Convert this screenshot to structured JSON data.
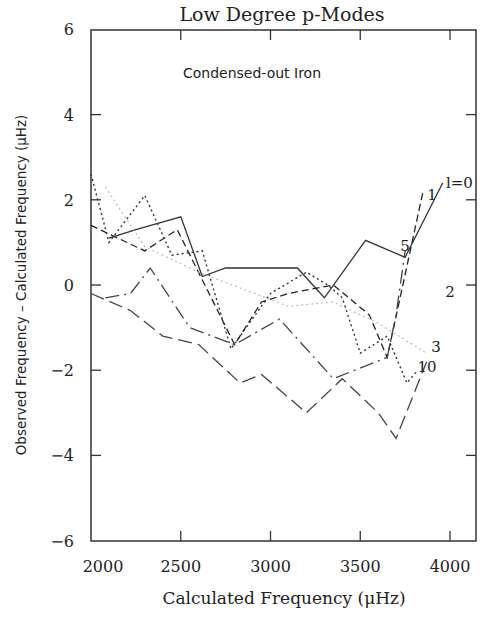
{
  "chart_data": {
    "type": "line",
    "title": "Low Degree p-Modes",
    "annotation": "Condensed-out Iron",
    "xlabel": "Calculated Frequency (μHz)",
    "ylabel": "Observed Frequency – Calculated Frequency (μHz)",
    "xlim": [
      2000,
      4150
    ],
    "ylim": [
      -6,
      6
    ],
    "xticks": [
      2000,
      2500,
      3000,
      3500,
      4000
    ],
    "yticks": [
      6,
      4,
      2,
      0,
      -2,
      -4,
      -6
    ],
    "xtick_labels": [
      "2000",
      "2500",
      "3000",
      "3500",
      "4000"
    ],
    "ytick_labels": [
      "6",
      "4",
      "2",
      "0",
      "−2",
      "−4",
      "−6"
    ],
    "grid": false,
    "legend": "inline labels at line ends",
    "series": [
      {
        "name": "l=0",
        "label": "l=0",
        "style": "solid",
        "x": [
          2100,
          2250,
          2500,
          2620,
          2750,
          3150,
          3300,
          3530,
          3750,
          3960
        ],
        "y": [
          1.1,
          1.3,
          1.6,
          0.2,
          0.4,
          0.4,
          -0.3,
          1.05,
          0.65,
          2.4
        ]
      },
      {
        "name": "l=1",
        "label": "1",
        "style": "short-dash",
        "x": [
          2000,
          2100,
          2300,
          2480,
          2800,
          2950,
          3100,
          3350,
          3550,
          3650,
          3850
        ],
        "y": [
          1.4,
          1.2,
          0.8,
          1.3,
          -1.4,
          -0.4,
          -0.2,
          0.0,
          -0.7,
          -1.7,
          2.2
        ]
      },
      {
        "name": "l=2",
        "label": "2",
        "style": "dotted",
        "x": [
          2000,
          2100,
          2300,
          2450,
          2620,
          2780,
          3000,
          3200,
          3320,
          3400,
          3500,
          3650,
          3760,
          3820
        ],
        "y": [
          2.6,
          1.0,
          2.1,
          0.7,
          0.8,
          -1.5,
          -0.2,
          0.3,
          0.0,
          -0.3,
          -1.6,
          -1.2,
          -2.3,
          -2.0
        ]
      },
      {
        "name": "l=3",
        "label": "3",
        "style": "faint-dotted",
        "x": [
          2080,
          2300,
          2600,
          2850,
          3100,
          3350,
          3600,
          3870
        ],
        "y": [
          2.3,
          0.9,
          0.3,
          -0.1,
          -0.5,
          -0.4,
          -0.9,
          -1.6
        ]
      },
      {
        "name": "l=5",
        "label": "5",
        "style": "dash-dot",
        "x": [
          2080,
          2220,
          2330,
          2550,
          2800,
          3050,
          3350,
          3650,
          3700,
          3750
        ],
        "y": [
          -0.3,
          -0.2,
          0.4,
          -1.0,
          -1.4,
          -0.8,
          -2.2,
          -1.7,
          -0.7,
          0.8
        ]
      },
      {
        "name": "l=10",
        "label": "10",
        "style": "long-dash",
        "x": [
          2000,
          2220,
          2400,
          2600,
          2830,
          2950,
          3200,
          3400,
          3600,
          3700,
          3870
        ],
        "y": [
          -0.2,
          -0.6,
          -1.2,
          -1.4,
          -2.3,
          -2.1,
          -3.0,
          -2.2,
          -3.0,
          -3.6,
          -1.8
        ]
      }
    ]
  }
}
